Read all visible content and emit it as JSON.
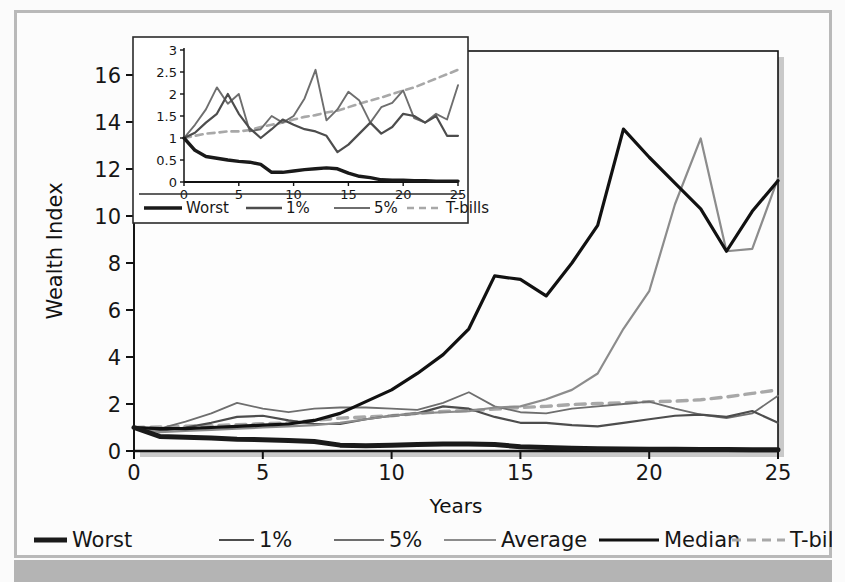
{
  "figure": {
    "background": "#fcfcfc",
    "frame_color": "#b9b9b9",
    "bottom_bar_color": "#b4b4b4"
  },
  "colors": {
    "worst": "#1a1a1a",
    "one_pct": "#4d4d4d",
    "five_pct": "#6e6e6e",
    "average": "#8c8c8c",
    "median": "#111111",
    "tbills": "#a8a8a8",
    "axis": "#111111",
    "text": "#161616"
  },
  "main_chart": {
    "xlabel": "Years",
    "ylabel": "Wealth Index",
    "xticks": [
      "0",
      "5",
      "10",
      "15",
      "20",
      "25"
    ],
    "yticks": [
      "0",
      "2",
      "4",
      "6",
      "8",
      "10",
      "12",
      "14",
      "16"
    ],
    "xlim": [
      0,
      25
    ],
    "ylim": [
      0,
      16
    ],
    "grid": false
  },
  "legend": {
    "position": "below-axis",
    "items": [
      {
        "label": "Worst",
        "color_key": "worst",
        "width": 5.0,
        "dash": "none"
      },
      {
        "label": "1%",
        "color_key": "one_pct",
        "width": 2.2,
        "dash": "none"
      },
      {
        "label": "5%",
        "color_key": "five_pct",
        "width": 1.8,
        "dash": "none"
      },
      {
        "label": "Average",
        "color_key": "average",
        "width": 2.0,
        "dash": "none"
      },
      {
        "label": "Median",
        "color_key": "median",
        "width": 3.2,
        "dash": "none"
      },
      {
        "label": "T-bills",
        "color_key": "tbills",
        "width": 3.0,
        "dash": "9,6"
      }
    ]
  },
  "inset_chart": {
    "xticks": [
      "0",
      "5",
      "10",
      "15",
      "20",
      "25"
    ],
    "yticks": [
      "0",
      "0.5",
      "1",
      "1.5",
      "2",
      "2.5",
      "3"
    ],
    "xlim": [
      0,
      25
    ],
    "ylim": [
      0,
      3
    ],
    "grid": false,
    "legend": {
      "items": [
        {
          "label": "Worst",
          "color_key": "worst",
          "width": 3.4,
          "dash": "none"
        },
        {
          "label": "1%",
          "color_key": "one_pct",
          "width": 2.4,
          "dash": "none"
        },
        {
          "label": "5%",
          "color_key": "five_pct",
          "width": 2.0,
          "dash": "none"
        },
        {
          "label": "T-bills",
          "color_key": "tbills",
          "width": 2.6,
          "dash": "7,5"
        }
      ]
    }
  },
  "chart_data": [
    {
      "id": "main",
      "type": "line",
      "title": "",
      "xlabel": "Years",
      "ylabel": "Wealth Index",
      "xlim": [
        0,
        25
      ],
      "ylim": [
        0,
        16
      ],
      "xticks": [
        0,
        5,
        10,
        15,
        20,
        25
      ],
      "yticks": [
        0,
        2,
        4,
        6,
        8,
        10,
        12,
        14,
        16
      ],
      "x": [
        0,
        1,
        2,
        3,
        4,
        5,
        6,
        7,
        8,
        9,
        10,
        11,
        12,
        13,
        14,
        15,
        16,
        17,
        18,
        19,
        20,
        21,
        22,
        23,
        24,
        25
      ],
      "series": [
        {
          "name": "Worst",
          "values": [
            1.0,
            0.62,
            0.58,
            0.55,
            0.5,
            0.48,
            0.45,
            0.4,
            0.25,
            0.22,
            0.25,
            0.28,
            0.3,
            0.3,
            0.28,
            0.18,
            0.15,
            0.12,
            0.1,
            0.08,
            0.07,
            0.07,
            0.06,
            0.06,
            0.05,
            0.05
          ]
        },
        {
          "name": "1%",
          "values": [
            1.0,
            0.85,
            1.0,
            1.2,
            1.45,
            1.5,
            1.3,
            1.15,
            1.15,
            1.35,
            1.5,
            1.6,
            1.9,
            1.8,
            1.45,
            1.2,
            1.2,
            1.1,
            1.05,
            1.2,
            1.35,
            1.5,
            1.55,
            1.45,
            1.7,
            1.2
          ]
        },
        {
          "name": "5%",
          "values": [
            1.0,
            0.95,
            1.25,
            1.6,
            2.05,
            1.8,
            1.65,
            1.8,
            1.85,
            1.85,
            1.8,
            1.75,
            2.05,
            2.5,
            1.9,
            1.65,
            1.6,
            1.8,
            1.9,
            2.0,
            2.1,
            1.8,
            1.55,
            1.4,
            1.6,
            2.35
          ]
        },
        {
          "name": "Average",
          "values": [
            1.0,
            0.8,
            0.85,
            0.9,
            0.95,
            1.0,
            1.05,
            1.1,
            1.2,
            1.35,
            1.5,
            1.6,
            1.65,
            1.7,
            1.85,
            1.9,
            2.2,
            2.6,
            3.3,
            5.2,
            6.8,
            10.5,
            13.3,
            8.5,
            8.6,
            11.6
          ]
        },
        {
          "name": "Median",
          "values": [
            1.0,
            0.95,
            0.95,
            1.0,
            1.05,
            1.1,
            1.15,
            1.3,
            1.6,
            2.1,
            2.6,
            3.3,
            4.1,
            5.2,
            7.45,
            7.3,
            6.6,
            8.0,
            9.6,
            13.7,
            12.5,
            11.4,
            10.3,
            8.5,
            10.2,
            11.5
          ]
        },
        {
          "name": "T-bills",
          "values": [
            1.0,
            1.02,
            1.05,
            1.08,
            1.12,
            1.16,
            1.2,
            1.3,
            1.4,
            1.45,
            1.5,
            1.6,
            1.68,
            1.72,
            1.78,
            1.85,
            1.9,
            1.98,
            2.02,
            2.05,
            2.1,
            2.12,
            2.18,
            2.3,
            2.45,
            2.6
          ]
        }
      ]
    },
    {
      "id": "inset",
      "type": "line",
      "title": "",
      "xlabel": "",
      "ylabel": "",
      "xlim": [
        0,
        25
      ],
      "ylim": [
        0,
        3
      ],
      "xticks": [
        0,
        5,
        10,
        15,
        20,
        25
      ],
      "yticks": [
        0,
        0.5,
        1,
        1.5,
        2,
        2.5,
        3
      ],
      "x": [
        0,
        1,
        2,
        3,
        4,
        5,
        6,
        7,
        8,
        9,
        10,
        11,
        12,
        13,
        14,
        15,
        16,
        17,
        18,
        19,
        20,
        21,
        22,
        23,
        24,
        25
      ],
      "series": [
        {
          "name": "Worst",
          "values": [
            1.0,
            0.72,
            0.58,
            0.54,
            0.5,
            0.47,
            0.45,
            0.4,
            0.22,
            0.22,
            0.25,
            0.28,
            0.3,
            0.32,
            0.3,
            0.2,
            0.13,
            0.1,
            0.05,
            0.04,
            0.04,
            0.03,
            0.03,
            0.02,
            0.02,
            0.02
          ]
        },
        {
          "name": "1%",
          "values": [
            1.0,
            1.12,
            1.35,
            1.55,
            2.0,
            1.55,
            1.22,
            1.0,
            1.2,
            1.42,
            1.3,
            1.2,
            1.15,
            1.05,
            0.68,
            0.85,
            1.1,
            1.35,
            1.1,
            1.25,
            1.55,
            1.5,
            1.35,
            1.5,
            1.05,
            1.05
          ]
        },
        {
          "name": "5%",
          "values": [
            1.0,
            1.3,
            1.65,
            2.15,
            1.78,
            2.0,
            1.15,
            1.2,
            1.5,
            1.35,
            1.5,
            1.9,
            2.55,
            1.4,
            1.65,
            2.05,
            1.85,
            1.35,
            1.7,
            1.8,
            2.08,
            1.45,
            1.35,
            1.55,
            1.42,
            2.2
          ]
        },
        {
          "name": "T-bills",
          "values": [
            1.0,
            1.05,
            1.1,
            1.12,
            1.15,
            1.15,
            1.18,
            1.25,
            1.3,
            1.35,
            1.42,
            1.48,
            1.52,
            1.58,
            1.62,
            1.7,
            1.78,
            1.85,
            1.92,
            2.0,
            2.08,
            2.15,
            2.25,
            2.35,
            2.45,
            2.55
          ]
        }
      ]
    }
  ]
}
